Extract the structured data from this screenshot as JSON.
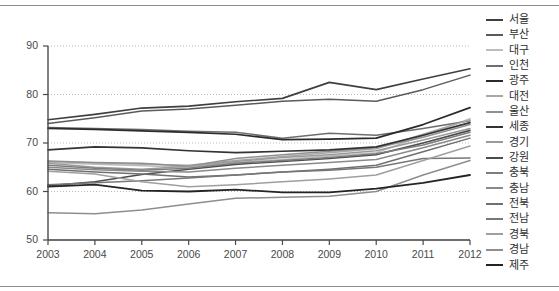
{
  "chart_data": {
    "type": "line",
    "title": "",
    "subtitle": "",
    "xlabel": "",
    "ylabel": "",
    "x": [
      2003,
      2004,
      2005,
      2006,
      2007,
      2008,
      2009,
      2010,
      2011,
      2012
    ],
    "xtick_labels": [
      "2003",
      "2004",
      "2005",
      "2006",
      "2007",
      "2008",
      "2009",
      "2010",
      "2011",
      "2012"
    ],
    "ytick_labels": [
      "50",
      "60",
      "70",
      "80",
      "90"
    ],
    "yticks": [
      50,
      60,
      70,
      80,
      90
    ],
    "ylim": [
      50,
      90
    ],
    "xlim": [
      2003,
      2012
    ],
    "grid": "horizontal-dotted",
    "legend_position": "right",
    "series": [
      {
        "name": "서울",
        "color": "#3f3f3f",
        "width": 1.6,
        "values": [
          74.8,
          75.9,
          77.2,
          77.6,
          78.5,
          79.2,
          82.5,
          81.0,
          83.2,
          85.3
        ]
      },
      {
        "name": "부산",
        "color": "#5a5a5a",
        "width": 1.5,
        "values": [
          74.0,
          75.2,
          76.6,
          77.0,
          77.8,
          78.6,
          79.0,
          78.6,
          81.0,
          84.0
        ]
      },
      {
        "name": "대구",
        "color": "#bdbdbd",
        "width": 1.5,
        "values": [
          66.0,
          65.6,
          65.3,
          65.0,
          66.0,
          66.6,
          67.3,
          68.0,
          71.5,
          75.0
        ]
      },
      {
        "name": "인천",
        "color": "#6e6e6e",
        "width": 1.5,
        "values": [
          73.2,
          73.0,
          72.8,
          72.4,
          72.2,
          71.0,
          72.0,
          71.6,
          73.0,
          74.6
        ]
      },
      {
        "name": "광주",
        "color": "#2b2b2b",
        "width": 1.7,
        "values": [
          73.0,
          72.8,
          72.5,
          72.2,
          71.8,
          70.7,
          70.8,
          71.0,
          73.8,
          77.3
        ]
      },
      {
        "name": "대전",
        "color": "#a8a8a8",
        "width": 1.5,
        "values": [
          66.2,
          65.9,
          65.6,
          65.4,
          66.4,
          67.2,
          68.0,
          68.8,
          71.8,
          74.8
        ]
      },
      {
        "name": "울산",
        "color": "#8f8f8f",
        "width": 1.5,
        "values": [
          66.3,
          66.0,
          65.8,
          65.2,
          66.8,
          67.6,
          68.3,
          69.0,
          71.2,
          73.8
        ]
      },
      {
        "name": "세종",
        "color": "#333333",
        "width": 1.7,
        "values": [
          68.6,
          69.2,
          69.0,
          68.4,
          68.0,
          68.3,
          68.6,
          69.2,
          71.6,
          74.2
        ]
      },
      {
        "name": "경기",
        "color": "#9a9a9a",
        "width": 1.5,
        "values": [
          65.8,
          65.0,
          64.6,
          65.2,
          66.2,
          67.0,
          67.6,
          68.4,
          70.6,
          73.0
        ]
      },
      {
        "name": "강원",
        "color": "#4c4c4c",
        "width": 1.6,
        "values": [
          61.2,
          62.0,
          63.5,
          64.6,
          65.6,
          66.2,
          66.8,
          67.6,
          70.0,
          72.6
        ]
      },
      {
        "name": "충북",
        "color": "#7d7d7d",
        "width": 1.5,
        "values": [
          65.4,
          64.8,
          64.4,
          64.8,
          65.8,
          66.4,
          67.0,
          67.8,
          69.6,
          72.2
        ]
      },
      {
        "name": "충남",
        "color": "#8a8a8a",
        "width": 1.5,
        "values": [
          65.0,
          64.5,
          64.2,
          64.0,
          64.8,
          65.4,
          66.0,
          66.6,
          69.0,
          71.6
        ]
      },
      {
        "name": "전북",
        "color": "#707070",
        "width": 1.5,
        "values": [
          64.6,
          64.0,
          63.6,
          63.0,
          63.4,
          64.0,
          64.6,
          65.4,
          68.2,
          71.0
        ]
      },
      {
        "name": "전남",
        "color": "#777777",
        "width": 1.5,
        "values": [
          61.4,
          61.8,
          62.2,
          62.8,
          63.4,
          64.0,
          64.4,
          65.0,
          66.8,
          66.9
        ]
      },
      {
        "name": "경북",
        "color": "#9f9f9f",
        "width": 1.5,
        "values": [
          64.2,
          63.6,
          62.0,
          61.0,
          61.4,
          62.0,
          62.6,
          63.4,
          66.4,
          69.4
        ]
      },
      {
        "name": "경남",
        "color": "#8e8e8e",
        "width": 1.5,
        "values": [
          55.6,
          55.4,
          56.2,
          57.4,
          58.6,
          58.8,
          59.0,
          60.0,
          63.4,
          66.4
        ]
      },
      {
        "name": "제주",
        "color": "#242424",
        "width": 1.8,
        "values": [
          61.0,
          61.4,
          60.2,
          60.0,
          60.4,
          59.8,
          59.8,
          60.6,
          61.8,
          63.4
        ]
      }
    ]
  }
}
